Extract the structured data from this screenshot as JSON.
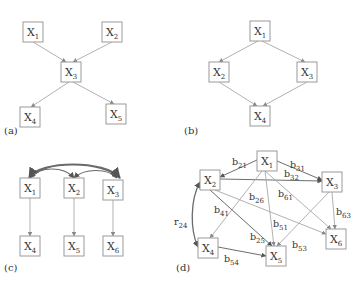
{
  "panels": [
    {
      "id": "a",
      "label": "(a)",
      "label_pos": [
        4,
        134
      ],
      "nodes": [
        {
          "id": "X1",
          "base": "X",
          "sub": "1",
          "x": 23,
          "y": 22,
          "w": 20,
          "h": 20
        },
        {
          "id": "X2",
          "base": "X",
          "sub": "2",
          "x": 102,
          "y": 22,
          "w": 20,
          "h": 20
        },
        {
          "id": "X3",
          "base": "X",
          "sub": "3",
          "x": 61,
          "y": 62,
          "w": 20,
          "h": 20
        },
        {
          "id": "X4",
          "base": "X",
          "sub": "4",
          "x": 20,
          "y": 107,
          "w": 20,
          "h": 20
        },
        {
          "id": "X5",
          "base": "X",
          "sub": "5",
          "x": 106,
          "y": 104,
          "w": 20,
          "h": 20
        }
      ],
      "edges": [
        {
          "from": "X1",
          "to": "X3",
          "path": [
            [
              33,
              42
            ],
            [
              66,
              62
            ]
          ]
        },
        {
          "from": "X2",
          "to": "X3",
          "path": [
            [
              112,
              42
            ],
            [
              73,
              62
            ]
          ]
        },
        {
          "from": "X3",
          "to": "X4",
          "path": [
            [
              69,
              82
            ],
            [
              31,
              107
            ]
          ]
        },
        {
          "from": "X3",
          "to": "X5",
          "path": [
            [
              73,
              82
            ],
            [
              114,
              104
            ]
          ]
        }
      ]
    },
    {
      "id": "b",
      "label": "(b)",
      "label_pos": [
        184,
        134
      ],
      "nodes": [
        {
          "id": "X1",
          "base": "X",
          "sub": "1",
          "x": 250,
          "y": 21,
          "w": 20,
          "h": 20
        },
        {
          "id": "X2",
          "base": "X",
          "sub": "2",
          "x": 209,
          "y": 62,
          "w": 20,
          "h": 20
        },
        {
          "id": "X3",
          "base": "X",
          "sub": "3",
          "x": 297,
          "y": 62,
          "w": 20,
          "h": 20
        },
        {
          "id": "X4",
          "base": "X",
          "sub": "4",
          "x": 250,
          "y": 106,
          "w": 20,
          "h": 20
        }
      ],
      "edges": [
        {
          "from": "X1",
          "to": "X2",
          "path": [
            [
              258,
              41
            ],
            [
              219,
              62
            ]
          ]
        },
        {
          "from": "X1",
          "to": "X3",
          "path": [
            [
              262,
              41
            ],
            [
              305,
              62
            ]
          ]
        },
        {
          "from": "X2",
          "to": "X4",
          "path": [
            [
              219,
              82
            ],
            [
              257,
              106
            ]
          ]
        },
        {
          "from": "X3",
          "to": "X4",
          "path": [
            [
              307,
              82
            ],
            [
              263,
              106
            ]
          ]
        }
      ]
    },
    {
      "id": "c",
      "label": "(c)",
      "label_pos": [
        4,
        271
      ],
      "nodes": [
        {
          "id": "X1",
          "base": "X",
          "sub": "1",
          "x": 20,
          "y": 178,
          "w": 20,
          "h": 20
        },
        {
          "id": "X2",
          "base": "X",
          "sub": "2",
          "x": 64,
          "y": 178,
          "w": 20,
          "h": 20
        },
        {
          "id": "X3",
          "base": "X",
          "sub": "3",
          "x": 103,
          "y": 180,
          "w": 20,
          "h": 20
        },
        {
          "id": "X4",
          "base": "X",
          "sub": "4",
          "x": 20,
          "y": 236,
          "w": 20,
          "h": 20
        },
        {
          "id": "X5",
          "base": "X",
          "sub": "5",
          "x": 64,
          "y": 236,
          "w": 20,
          "h": 20
        },
        {
          "id": "X6",
          "base": "X",
          "sub": "6",
          "x": 103,
          "y": 236,
          "w": 20,
          "h": 20
        }
      ],
      "edges": [
        {
          "from": "X1",
          "to": "X4",
          "path": [
            [
              30,
              198
            ],
            [
              30,
              236
            ]
          ]
        },
        {
          "from": "X2",
          "to": "X5",
          "path": [
            [
              74,
              198
            ],
            [
              74,
              236
            ]
          ]
        },
        {
          "from": "X3",
          "to": "X6",
          "path": [
            [
              113,
              200
            ],
            [
              113,
              236
            ]
          ]
        }
      ],
      "arcs": [
        {
          "between": [
            "X1",
            "X3"
          ],
          "d": "M29,178 C40,160 105,160 120,178",
          "width": 2.2
        },
        {
          "between": [
            "X1",
            "X2"
          ],
          "d": "M30,178 C40,166 64,166 74,178",
          "width": 1.2
        },
        {
          "between": [
            "X2",
            "X3"
          ],
          "d": "M74,178 C84,168 108,168 117,178",
          "width": 1.2
        }
      ]
    },
    {
      "id": "d",
      "label": "(d)",
      "label_pos": [
        176,
        271
      ],
      "nodes": [
        {
          "id": "X1",
          "base": "X",
          "sub": "1",
          "x": 257,
          "y": 151,
          "w": 20,
          "h": 20
        },
        {
          "id": "X2",
          "base": "X",
          "sub": "2",
          "x": 200,
          "y": 170,
          "w": 20,
          "h": 20
        },
        {
          "id": "X3",
          "base": "X",
          "sub": "3",
          "x": 322,
          "y": 172,
          "w": 20,
          "h": 20
        },
        {
          "id": "X4",
          "base": "X",
          "sub": "4",
          "x": 198,
          "y": 238,
          "w": 20,
          "h": 20
        },
        {
          "id": "X5",
          "base": "X",
          "sub": "5",
          "x": 266,
          "y": 246,
          "w": 20,
          "h": 20
        },
        {
          "id": "X6",
          "base": "X",
          "sub": "6",
          "x": 326,
          "y": 229,
          "w": 20,
          "h": 20
        }
      ],
      "edges": [
        {
          "from": "X1",
          "to": "X2",
          "label": "b21",
          "label_base": "b",
          "label_sub": "21",
          "label_pos": [
            232,
            165
          ],
          "path": [
            [
              257,
              160
            ],
            [
              220,
              177
            ]
          ],
          "dark": true
        },
        {
          "from": "X1",
          "to": "X3",
          "label": "b31",
          "label_base": "b",
          "label_sub": "31",
          "label_pos": [
            290,
            168
          ],
          "path": [
            [
              277,
              161
            ],
            [
              322,
              180
            ]
          ],
          "dark": true
        },
        {
          "from": "X2",
          "to": "X3",
          "label": "b32",
          "label_base": "b",
          "label_sub": "32",
          "label_pos": [
            284,
            177
          ],
          "path": [
            [
              220,
              179
            ],
            [
              322,
              181
            ]
          ],
          "dark": true
        },
        {
          "from": "X2",
          "to": "X6",
          "label": "b26",
          "label_base": "b",
          "label_sub": "26",
          "label_pos": [
            249,
            200
          ],
          "path": [
            [
              215,
              190
            ],
            [
              326,
              234
            ]
          ],
          "dark": false
        },
        {
          "from": "X1",
          "to": "X6",
          "label": "b61",
          "label_base": "b",
          "label_sub": "61",
          "label_pos": [
            278,
            197
          ],
          "path": [
            [
              265,
              171
            ],
            [
              331,
              229
            ]
          ],
          "dark": false
        },
        {
          "from": "X1",
          "to": "X4",
          "label": "b41",
          "label_base": "b",
          "label_sub": "41",
          "label_pos": [
            214,
            213
          ],
          "path": [
            [
              262,
              171
            ],
            [
              210,
              238
            ]
          ],
          "dark": false
        },
        {
          "from": "X1",
          "to": "X5",
          "label": "b51",
          "label_base": "b",
          "label_sub": "51",
          "label_pos": [
            273,
            227
          ],
          "path": [
            [
              265,
              171
            ],
            [
              274,
              246
            ]
          ],
          "dark": false
        },
        {
          "from": "X2",
          "to": "X5",
          "label": "b25",
          "label_base": "b",
          "label_sub": "25",
          "label_pos": [
            250,
            240
          ],
          "path": [
            [
              210,
              190
            ],
            [
              272,
              246
            ]
          ],
          "dark": true
        },
        {
          "from": "X3",
          "to": "X5",
          "label": "b53",
          "label_base": "b",
          "label_sub": "53",
          "label_pos": [
            292,
            248
          ],
          "path": [
            [
              329,
              192
            ],
            [
              277,
              246
            ]
          ],
          "dark": false
        },
        {
          "from": "X3",
          "to": "X6",
          "label": "b63",
          "label_base": "b",
          "label_sub": "63",
          "label_pos": [
            336,
            215
          ],
          "path": [
            [
              332,
              192
            ],
            [
              335,
              229
            ]
          ],
          "dark": false
        },
        {
          "from": "X4",
          "to": "X5",
          "label": "b54",
          "label_base": "b",
          "label_sub": "54",
          "label_pos": [
            224,
            262
          ],
          "path": [
            [
              218,
              247
            ],
            [
              266,
              256
            ]
          ],
          "dark": true
        }
      ],
      "arcs": [
        {
          "between": [
            "X2",
            "X4"
          ],
          "label": "r24",
          "label_base": "r",
          "label_sub": "24",
          "label_pos": [
            174,
            225
          ],
          "d": "M200,182 C190,200 190,230 198,247",
          "width": 1.3
        }
      ]
    }
  ]
}
